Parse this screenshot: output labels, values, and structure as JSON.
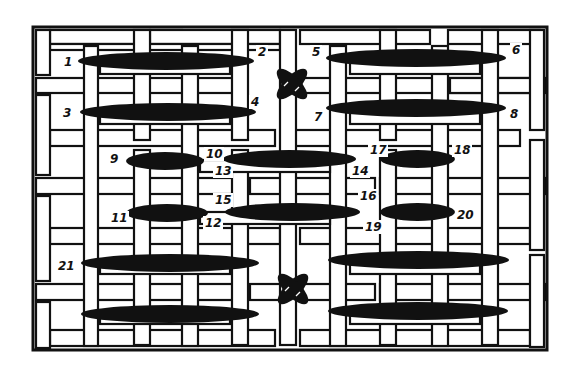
{
  "diagram": {
    "type": "stitch-pattern",
    "colors": {
      "background": "#ffffff",
      "ink": "#111111",
      "frame": "#111111"
    },
    "frame": {
      "x": 33,
      "y": 27,
      "w": 514,
      "h": 323
    },
    "stitches": [
      {
        "id": "s1",
        "x1": 78,
        "x2": 254,
        "y": 61,
        "start": "1",
        "end": "2"
      },
      {
        "id": "s2",
        "x1": 326,
        "x2": 506,
        "y": 58,
        "start": "5",
        "end": "6"
      },
      {
        "id": "s3",
        "x1": 80,
        "x2": 256,
        "y": 112,
        "start": "3",
        "end": "4"
      },
      {
        "id": "s4",
        "x1": 326,
        "x2": 506,
        "y": 108,
        "start": "7",
        "end": "8"
      },
      {
        "id": "s5",
        "x1": 126,
        "x2": 204,
        "y": 161,
        "start": "9",
        "end": "10"
      },
      {
        "id": "s6",
        "x1": 223,
        "x2": 356,
        "y": 159,
        "start": "13",
        "end": "14"
      },
      {
        "id": "s7",
        "x1": 380,
        "x2": 455,
        "y": 159,
        "start": "17",
        "end": "18"
      },
      {
        "id": "s8",
        "x1": 126,
        "x2": 208,
        "y": 213,
        "start": "11",
        "end": "12"
      },
      {
        "id": "s9",
        "x1": 225,
        "x2": 360,
        "y": 212,
        "start": "15",
        "end": "16"
      },
      {
        "id": "s10",
        "x1": 380,
        "x2": 455,
        "y": 212,
        "start": "19",
        "end": "20"
      },
      {
        "id": "s11",
        "x1": 81,
        "x2": 259,
        "y": 263,
        "start": "21",
        "end": ""
      },
      {
        "id": "s12",
        "x1": 328,
        "x2": 509,
        "y": 260,
        "start": "",
        "end": ""
      },
      {
        "id": "s13",
        "x1": 81,
        "x2": 259,
        "y": 314,
        "start": "",
        "end": ""
      },
      {
        "id": "s14",
        "x1": 328,
        "x2": 508,
        "y": 311,
        "start": "",
        "end": ""
      }
    ],
    "cross_stitches": [
      {
        "id": "x1",
        "cx": 292,
        "cy": 84
      },
      {
        "id": "x2",
        "cx": 293,
        "cy": 289
      }
    ],
    "labels": [
      {
        "text": "1",
        "x": 64,
        "y": 66
      },
      {
        "text": "2",
        "x": 258,
        "y": 56
      },
      {
        "text": "5",
        "x": 312,
        "y": 56
      },
      {
        "text": "6",
        "x": 512,
        "y": 54
      },
      {
        "text": "3",
        "x": 63,
        "y": 117
      },
      {
        "text": "4",
        "x": 251,
        "y": 106
      },
      {
        "text": "7",
        "x": 314,
        "y": 121
      },
      {
        "text": "8",
        "x": 510,
        "y": 118
      },
      {
        "text": "9",
        "x": 110,
        "y": 163
      },
      {
        "text": "10",
        "x": 206,
        "y": 158
      },
      {
        "text": "17",
        "x": 370,
        "y": 154
      },
      {
        "text": "18",
        "x": 454,
        "y": 154
      },
      {
        "text": "13",
        "x": 215,
        "y": 175
      },
      {
        "text": "14",
        "x": 352,
        "y": 175
      },
      {
        "text": "15",
        "x": 215,
        "y": 204
      },
      {
        "text": "16",
        "x": 360,
        "y": 200
      },
      {
        "text": "11",
        "x": 111,
        "y": 222
      },
      {
        "text": "12",
        "x": 205,
        "y": 227
      },
      {
        "text": "19",
        "x": 365,
        "y": 231
      },
      {
        "text": "20",
        "x": 457,
        "y": 219
      },
      {
        "text": "21",
        "x": 58,
        "y": 270
      }
    ]
  }
}
